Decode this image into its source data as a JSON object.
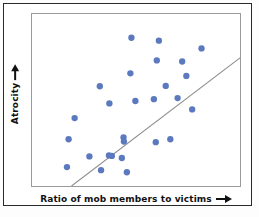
{
  "chart_data": {
    "type": "scatter",
    "title": "",
    "xlabel": "Ratio of mob members to victims",
    "ylabel": "Atrocity",
    "xlabel_arrow": "right-arrow",
    "ylabel_arrow": "up-arrow",
    "xlim": [
      0,
      1
    ],
    "ylim": [
      0,
      1
    ],
    "grid": false,
    "legend": false,
    "axis_ticks": false,
    "point_color": "#5B79BE",
    "point_radius": 3.2,
    "line_color": "#8d8d8d",
    "frame_color": "#9a9a9a",
    "outer_border_color": "#2a2a2a",
    "background_color": "#ffffff",
    "note": "Axes are unlabeled/unscaled; values are normalized 0-1 read off pixel positions.",
    "points": [
      {
        "x": 0.478,
        "y": 0.862
      },
      {
        "x": 0.61,
        "y": 0.845
      },
      {
        "x": 0.6,
        "y": 0.73
      },
      {
        "x": 0.722,
        "y": 0.724
      },
      {
        "x": 0.473,
        "y": 0.655
      },
      {
        "x": 0.326,
        "y": 0.58
      },
      {
        "x": 0.643,
        "y": 0.582
      },
      {
        "x": 0.7,
        "y": 0.511
      },
      {
        "x": 0.586,
        "y": 0.505
      },
      {
        "x": 0.497,
        "y": 0.494
      },
      {
        "x": 0.77,
        "y": 0.445
      },
      {
        "x": 0.176,
        "y": 0.272
      },
      {
        "x": 0.44,
        "y": 0.282
      },
      {
        "x": 0.442,
        "y": 0.258
      },
      {
        "x": 0.595,
        "y": 0.255
      },
      {
        "x": 0.665,
        "y": 0.272
      },
      {
        "x": 0.276,
        "y": 0.172
      },
      {
        "x": 0.37,
        "y": 0.178
      },
      {
        "x": 0.384,
        "y": 0.175
      },
      {
        "x": 0.432,
        "y": 0.163
      },
      {
        "x": 0.168,
        "y": 0.11
      },
      {
        "x": 0.332,
        "y": 0.092
      },
      {
        "x": 0.456,
        "y": 0.08
      },
      {
        "x": 0.815,
        "y": 0.8
      },
      {
        "x": 0.742,
        "y": 0.64
      },
      {
        "x": 0.205,
        "y": 0.395
      },
      {
        "x": 0.372,
        "y": 0.48
      }
    ],
    "trend_line": {
      "x0": 0.19,
      "y0": 0.0,
      "x1": 1.0,
      "y1": 0.745
    }
  }
}
